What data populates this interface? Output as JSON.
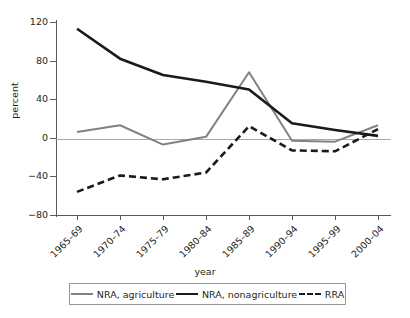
{
  "chart_data": {
    "type": "line",
    "title": "",
    "xlabel": "year",
    "ylabel": "percent",
    "categories": [
      "1965–69",
      "1970–74",
      "1975–79",
      "1980–84",
      "1985–89",
      "1990–94",
      "1995–99",
      "2000–04"
    ],
    "ylim": [
      -80,
      120
    ],
    "yticks": [
      120,
      80,
      40,
      0,
      -40,
      -80
    ],
    "ytick_labels": [
      "120",
      "80",
      "40",
      "0",
      "−40",
      "−80"
    ],
    "grid": false,
    "legend_position": "bottom",
    "series": [
      {
        "name": "NRA, agriculture",
        "color": "#808285",
        "style": "solid",
        "values": [
          6,
          13,
          -7,
          1,
          68,
          -3,
          -4,
          13
        ]
      },
      {
        "name": "NRA, nonagriculture",
        "color": "#1a1a1a",
        "style": "solid",
        "values": [
          113,
          82,
          65,
          58,
          50,
          15,
          8,
          2
        ]
      },
      {
        "name": "RRA",
        "color": "#1a1a1a",
        "style": "dashed",
        "values": [
          -56,
          -39,
          -43,
          -36,
          12,
          -13,
          -14,
          9
        ]
      }
    ]
  },
  "legend": {
    "items": [
      {
        "label": "NRA, agriculture",
        "swatch": "solid-gray-line"
      },
      {
        "label": "NRA, nonagriculture",
        "swatch": "solid-black-line"
      },
      {
        "label": "RRA",
        "swatch": "dashed-black-line"
      }
    ]
  }
}
